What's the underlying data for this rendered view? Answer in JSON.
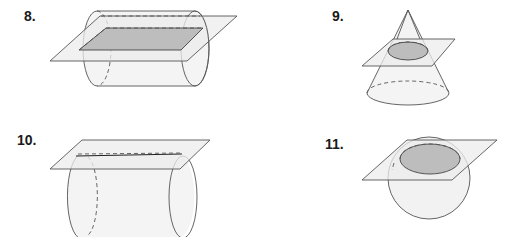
{
  "problems": [
    {
      "number": "8.",
      "shape": "cylinder",
      "cross_section": "rectangle",
      "plane": "horizontal through axis"
    },
    {
      "number": "9.",
      "shape": "cone",
      "cross_section": "circle",
      "plane": "parallel to base"
    },
    {
      "number": "10.",
      "shape": "cylinder",
      "cross_section": "line segment",
      "plane": "tangent to side"
    },
    {
      "number": "11.",
      "shape": "sphere",
      "cross_section": "circle",
      "plane": "intersecting upper part"
    }
  ],
  "colors": {
    "outline": "#555555",
    "plane": "#ececec",
    "section": "#bdbdbd",
    "solid": "#f4f4f4"
  }
}
